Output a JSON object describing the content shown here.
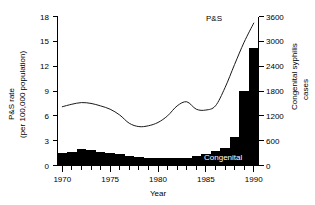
{
  "chart_data": {
    "type": "bar",
    "title": "",
    "xlabel": "Year",
    "x": [
      1970,
      1971,
      1972,
      1973,
      1974,
      1975,
      1976,
      1977,
      1978,
      1979,
      1980,
      1981,
      1982,
      1983,
      1984,
      1985,
      1986,
      1987,
      1988,
      1989,
      1990
    ],
    "xlim": [
      1969.5,
      1990.5
    ],
    "xticks": [
      1970,
      1975,
      1980,
      1985,
      1990
    ],
    "xticklabels": [
      "1970",
      "1975",
      "1980",
      "1985",
      "1990"
    ],
    "xminorticks": [
      1971,
      1972,
      1973,
      1974,
      1976,
      1977,
      1978,
      1979,
      1981,
      1982,
      1983,
      1984,
      1986,
      1987,
      1988,
      1989
    ],
    "grid": false,
    "legend_position": "inline-annotations",
    "left_axis": {
      "label_line1": "P&S rate",
      "label_line2": "(per 100,000 population)",
      "ticks": [
        0,
        3,
        6,
        9,
        12,
        15,
        18
      ],
      "ticklabels": [
        "0",
        "3",
        "6",
        "9",
        "12",
        "15",
        "18"
      ],
      "lim": [
        0,
        18
      ]
    },
    "right_axis": {
      "label_line1": "Congenital syphilis",
      "label_line2": "cases",
      "ticks": [
        0,
        600,
        1200,
        1800,
        2400,
        3000,
        3600
      ],
      "ticklabels": [
        "0",
        "600",
        "1200",
        "1800",
        "2400",
        "3000",
        "3600"
      ],
      "lim": [
        0,
        3600
      ]
    },
    "series": [
      {
        "name": "Congenital",
        "render": "bar",
        "axis": "right",
        "color": "#000000",
        "annotation": "Congenital",
        "annotation_color": "#ffffff",
        "values": [
          300,
          330,
          410,
          370,
          330,
          300,
          280,
          240,
          200,
          190,
          180,
          170,
          175,
          190,
          220,
          270,
          340,
          430,
          680,
          1800,
          2850
        ]
      },
      {
        "name": "P&S",
        "render": "line",
        "axis": "left",
        "color": "#1a1a1a",
        "annotation": "P&S",
        "annotation_color": "#000000",
        "values": [
          7.1,
          7.4,
          7.6,
          7.5,
          7.2,
          6.8,
          6.1,
          5.1,
          4.7,
          4.8,
          5.2,
          6.0,
          7.2,
          7.7,
          6.8,
          6.7,
          7.2,
          9.4,
          12.2,
          14.9,
          17.2
        ]
      }
    ]
  }
}
